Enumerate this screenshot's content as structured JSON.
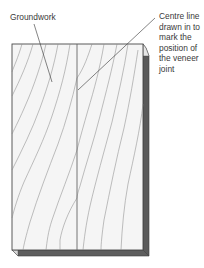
{
  "diagram": {
    "type": "veneer-groundwork-illustration",
    "labels": {
      "groundwork": "Groundwork",
      "centre_line": [
        "Centre line",
        "drawn in to",
        "mark the",
        "position of",
        "the veneer",
        "joint"
      ]
    },
    "colors": {
      "board_face": "#f5f5f5",
      "board_outline": "#4a4a4a",
      "board_edge_dark": "#5a5a5a",
      "grain": "#8c8c8c",
      "leader_line": "#333333",
      "text": "#3a3a3a"
    }
  }
}
